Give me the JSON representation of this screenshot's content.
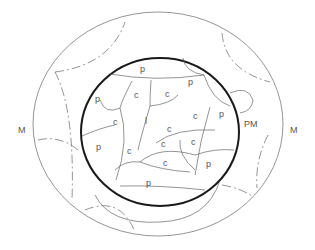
{
  "diagram": {
    "labels": {
      "meristem_left": "M",
      "meristem_right": "M",
      "promeristem": "PM",
      "peripheral": "p",
      "central": "c",
      "inner": "l"
    },
    "colors": {
      "background": "#ffffff",
      "outline": "#1a1a1a",
      "lines": "#666666",
      "text": "#555555"
    }
  }
}
